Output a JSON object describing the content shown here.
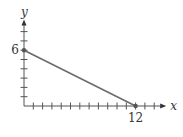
{
  "chart_data": {
    "type": "line",
    "title": "",
    "xlabel": "x",
    "ylabel": "y",
    "xlim": [
      0,
      14
    ],
    "ylim": [
      0,
      8
    ],
    "x_ticks": [
      1,
      2,
      3,
      4,
      5,
      6,
      7,
      8,
      9,
      10,
      11,
      12,
      13,
      14
    ],
    "y_ticks": [
      1,
      2,
      3,
      4,
      5,
      6,
      7,
      8
    ],
    "labeled_ticks": {
      "x": [
        "12"
      ],
      "y": [
        "6"
      ]
    },
    "grid": false,
    "series": [
      {
        "name": "segment",
        "points": [
          [
            0,
            6
          ],
          [
            12,
            0
          ]
        ],
        "color": "#6b6b6b",
        "markers": true
      }
    ]
  }
}
